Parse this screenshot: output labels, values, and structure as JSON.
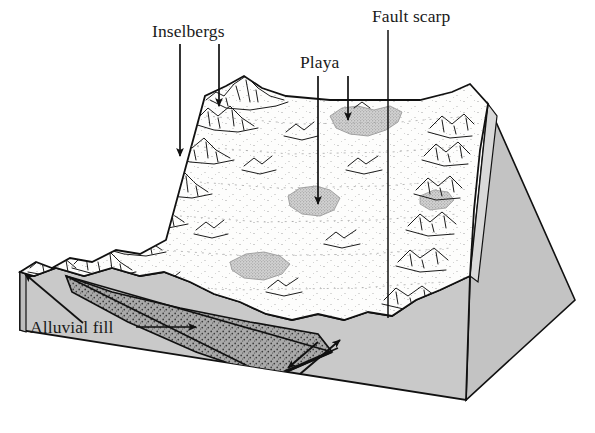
{
  "figure": {
    "kind": "geologic-block-diagram",
    "background_color": "#ffffff",
    "ink_color": "#1a1a1a"
  },
  "labels": [
    {
      "id": "inselbergs",
      "text": "Inselbergs",
      "x": 152,
      "y": 37,
      "anchor": "start",
      "name": "label-inselbergs"
    },
    {
      "id": "playa",
      "text": "Playa",
      "x": 300,
      "y": 68,
      "anchor": "start",
      "name": "label-playa"
    },
    {
      "id": "fault_scarp",
      "text": "Fault scarp",
      "x": 372,
      "y": 22,
      "anchor": "start",
      "name": "label-fault-scarp"
    },
    {
      "id": "alluvial_fill",
      "text": "Alluvial fill",
      "x": 30,
      "y": 333,
      "anchor": "start",
      "name": "label-alluvial-fill"
    }
  ],
  "leaders": [
    {
      "id": "inselbergs-left",
      "from": [
        180,
        44
      ],
      "to": [
        180,
        156
      ],
      "arrow": true,
      "name": "leader-inselbergs-left"
    },
    {
      "id": "inselbergs-right",
      "from": [
        219,
        44
      ],
      "to": [
        219,
        106
      ],
      "arrow": true,
      "name": "leader-inselbergs-right"
    },
    {
      "id": "playa-lower",
      "from": [
        318,
        76
      ],
      "to": [
        318,
        204
      ],
      "arrow": true,
      "name": "leader-playa-lower"
    },
    {
      "id": "playa-upper",
      "from": [
        348,
        76
      ],
      "to": [
        348,
        120
      ],
      "arrow": true,
      "name": "leader-playa-upper"
    },
    {
      "id": "fault-scarp-down",
      "from": [
        388,
        30
      ],
      "to": [
        388,
        318
      ],
      "arrow": false,
      "name": "leader-fault-scarp"
    },
    {
      "id": "alluvial-right",
      "from": [
        136,
        327
      ],
      "to": [
        196,
        327
      ],
      "arrow": true,
      "name": "leader-alluvial-fill-right"
    },
    {
      "id": "alluvial-up",
      "from": [
        83,
        323
      ],
      "to": [
        25,
        274
      ],
      "arrow": true,
      "name": "leader-alluvial-fill-up"
    }
  ],
  "colors": {
    "top_surface": "#fdfdfc",
    "front_face": "#c9c9c9",
    "right_face": "#c3c3c3",
    "right_edge_band": "#b0b0b0",
    "alluvial_fill": "#a8a8a8",
    "playa": "#cfcfcf",
    "outline": "#111111",
    "stipple": "#5a5a5a"
  },
  "geometry": {
    "top_surface_corners": {
      "left": [
        20,
        272
      ],
      "back_left": [
        205,
        96
      ],
      "back_right": [
        488,
        104
      ],
      "right": [
        470,
        276
      ]
    },
    "front_bottom": {
      "left": [
        20,
        330
      ],
      "right": [
        466,
        400
      ]
    },
    "right_bottom": [
      575,
      300
    ],
    "fault_plane": {
      "top": [
        332,
        352
      ],
      "bottom": [
        272,
        378
      ]
    }
  },
  "features": {
    "playa_count": 5,
    "inselberg_clusters": 22,
    "fault_type": "normal-fault",
    "fault_motion_arrows": 2
  }
}
